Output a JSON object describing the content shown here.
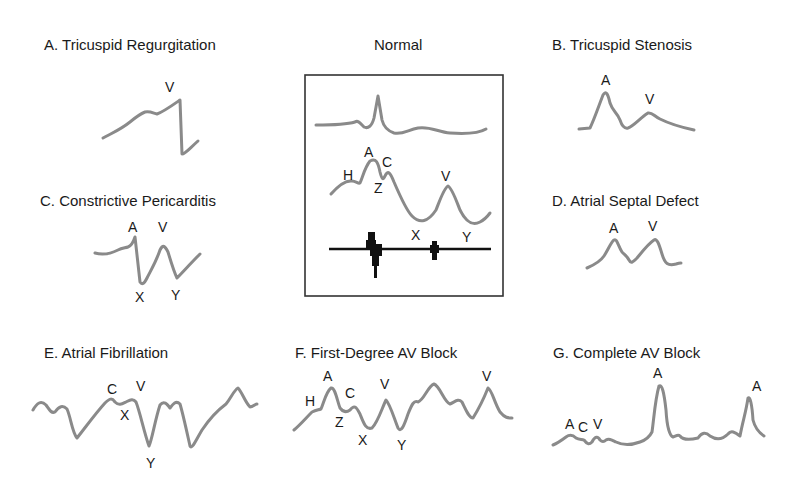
{
  "figure": {
    "panels": [
      {
        "id": "A",
        "title": "A. Tricuspid Regurgitation",
        "wave_labels": [
          "V"
        ]
      },
      {
        "id": "Normal",
        "title": "Normal",
        "wave_labels": [
          "H",
          "A",
          "C",
          "Z",
          "V",
          "X",
          "Y"
        ],
        "traces": [
          "ECG",
          "Jugular venous pulse",
          "Heart sounds"
        ]
      },
      {
        "id": "B",
        "title": "B. Tricuspid Stenosis",
        "wave_labels": [
          "A",
          "V"
        ]
      },
      {
        "id": "C",
        "title": "C. Constrictive Pericarditis",
        "wave_labels": [
          "A",
          "V",
          "X",
          "Y"
        ]
      },
      {
        "id": "D",
        "title": "D. Atrial Septal Defect",
        "wave_labels": [
          "A",
          "V"
        ]
      },
      {
        "id": "E",
        "title": "E. Atrial Fibrillation",
        "wave_labels": [
          "C",
          "V",
          "X",
          "Y"
        ]
      },
      {
        "id": "F",
        "title": "F. First-Degree AV Block",
        "wave_labels": [
          "H",
          "A",
          "C",
          "Z",
          "V",
          "X",
          "Y",
          "V"
        ]
      },
      {
        "id": "G",
        "title": "G. Complete AV Block",
        "wave_labels": [
          "A",
          "C",
          "V",
          "A",
          "A"
        ]
      }
    ],
    "colors": {
      "waveform": "#8a8a8a",
      "text": "#1a1a1a",
      "box": "#333333",
      "heart_sounds": "#111111"
    }
  }
}
